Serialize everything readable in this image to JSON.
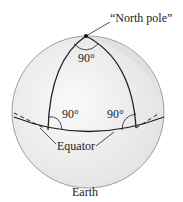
{
  "diagram": {
    "labels": {
      "north_pole": "“North pole”",
      "angle_top": "90°",
      "angle_left": "90°",
      "angle_right": "90°",
      "equator": "Equator",
      "earth": "Earth"
    },
    "colors": {
      "sphere_fill": "#f4f4f4",
      "shade": "#e6e6e6",
      "line": "#222222",
      "outline": "#888888"
    }
  }
}
